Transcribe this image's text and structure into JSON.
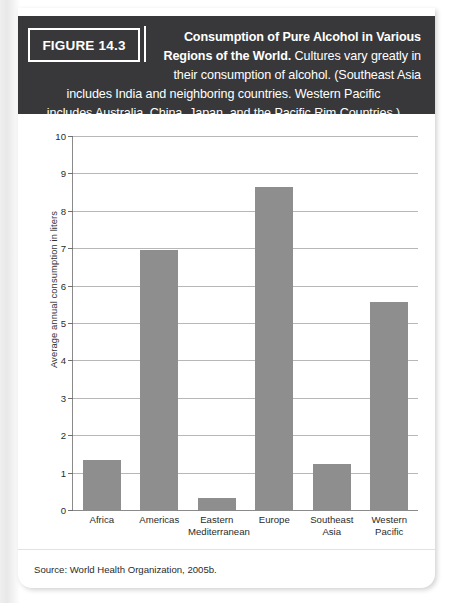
{
  "figure": {
    "tag": "FIGURE 14.3",
    "caption_line1": "Consumption of Pure Alcohol in Various",
    "caption_line2": "Regions of the World.",
    "caption_line2_rest": " Cultures vary greatly in",
    "caption_line3": "their consumption of alcohol. (Southeast Asia",
    "caption_line4": "includes India and neighboring countries. Western Pacific",
    "caption_line5": "includes Australia, China, Japan, and the Pacific Rim Countries.)"
  },
  "source": "Source: World Health Organization, 2005b.",
  "colors": {
    "bar": "#8e8e8e",
    "banner": "#38383a",
    "gridline": "#b7b7b7",
    "axis": "#8a8a8a"
  },
  "chart_data": {
    "type": "bar",
    "title": "Consumption of Pure Alcohol in Various Regions of the World",
    "xlabel": "",
    "ylabel": "Average annual consumption in liters",
    "categories": [
      "Africa",
      "Eastern\nMediterranean",
      "Americas",
      "Europe",
      "Southeast\nAsia",
      "Western\nPacific"
    ],
    "category_labels": [
      {
        "line1": "Africa",
        "line2": ""
      },
      {
        "line1": "Americas",
        "line2": ""
      },
      {
        "line1": "Eastern",
        "line2": "Mediterranean"
      },
      {
        "line1": "Europe",
        "line2": ""
      },
      {
        "line1": "Southeast",
        "line2": "Asia"
      },
      {
        "line1": "Western",
        "line2": "Pacific"
      }
    ],
    "values": [
      1.35,
      6.95,
      0.33,
      8.65,
      1.22,
      5.55
    ],
    "ylim": [
      0,
      10
    ],
    "yticks": [
      0,
      1,
      2,
      3,
      4,
      5,
      6,
      7,
      8,
      9,
      10
    ],
    "ytick_labels": [
      "0",
      "1",
      "2",
      "3",
      "4",
      "5",
      "6",
      "7",
      "8",
      "9",
      "10"
    ],
    "grid": true,
    "legend": false
  }
}
